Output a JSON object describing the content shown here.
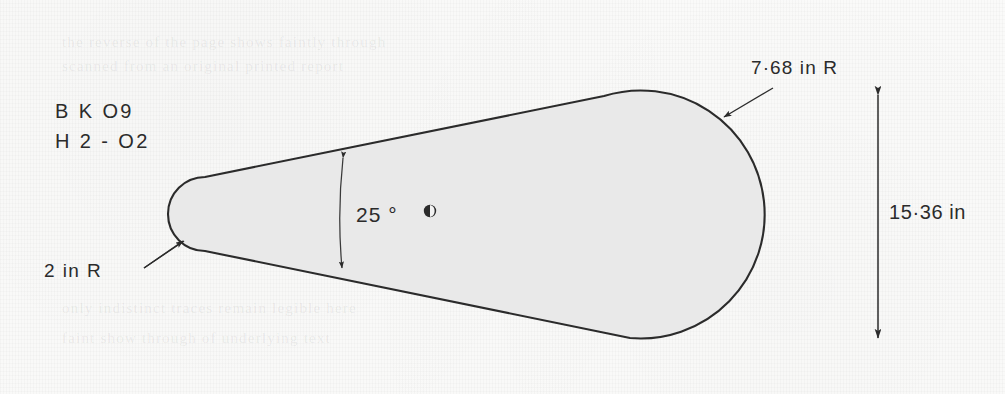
{
  "document": {
    "type": "engineering-drawing",
    "subject": "aerofoil-section-outline",
    "background_color": "#fbfbfa",
    "ink_color": "#2b2b2b",
    "fill_color": "#e9e9e9"
  },
  "labels": {
    "part_code_line1": "B K  O9",
    "part_code_line2": "H 2 - O2"
  },
  "dimensions": [
    {
      "id": "nose-radius",
      "text": "2 in R",
      "value": 2,
      "unit": "in",
      "kind": "radius",
      "leader": "arrow-up-right"
    },
    {
      "id": "tail-radius",
      "text": "7·68 in R",
      "value": 7.68,
      "unit": "in",
      "kind": "radius",
      "leader": "arrow-down-left"
    },
    {
      "id": "included-angle",
      "text": "25 °",
      "value": 25,
      "unit": "deg",
      "kind": "angle",
      "leader": "double-arrow-arc"
    },
    {
      "id": "overall-height",
      "text": "15·36 in",
      "value": 15.36,
      "unit": "in",
      "kind": "linear",
      "leader": "double-arrow-vertical"
    }
  ],
  "marks": [
    {
      "id": "centre-mark",
      "symbol": "filled-circle"
    }
  ],
  "ghost_text": [
    {
      "text": "the reverse of the page shows faintly through"
    },
    {
      "text": "scanned from an original printed report"
    },
    {
      "text": "only indistinct traces remain legible here"
    },
    {
      "text": "faint show through of underlying text"
    }
  ]
}
